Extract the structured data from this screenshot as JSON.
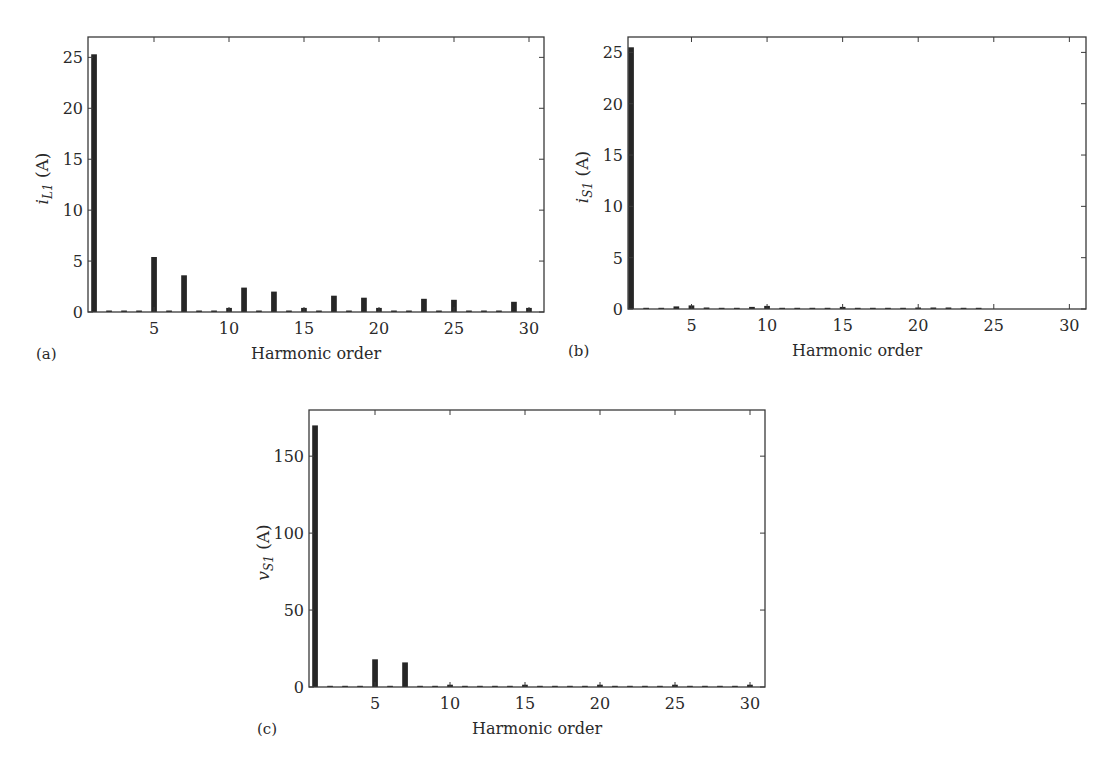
{
  "chart_data": [
    {
      "type": "bar",
      "panel_label": "(a)",
      "title": "",
      "xlabel": "Harmonic order",
      "ylabel": "i_L1 (A)",
      "ylabel_parts": {
        "symbol": "i",
        "subscript": "L1",
        "unit": "(A)"
      },
      "xlim": [
        0.6,
        31
      ],
      "ylim": [
        0,
        27
      ],
      "xticks": [
        5,
        10,
        15,
        20,
        25,
        30
      ],
      "yticks": [
        0,
        5,
        10,
        15,
        20,
        25
      ],
      "grid": false,
      "legend": null,
      "x": [
        1,
        2,
        3,
        4,
        5,
        6,
        7,
        8,
        9,
        10,
        11,
        12,
        13,
        14,
        15,
        16,
        17,
        18,
        19,
        20,
        21,
        22,
        23,
        24,
        25,
        26,
        27,
        28,
        29,
        30
      ],
      "values": [
        25.3,
        0.15,
        0.15,
        0.15,
        5.4,
        0.15,
        3.6,
        0.15,
        0.15,
        0.4,
        2.4,
        0.15,
        2.0,
        0.15,
        0.4,
        0.15,
        1.6,
        0.15,
        1.4,
        0.4,
        0.15,
        0.15,
        1.3,
        0.15,
        1.2,
        0.15,
        0.15,
        0.15,
        1.0,
        0.4
      ]
    },
    {
      "type": "bar",
      "panel_label": "(b)",
      "title": "",
      "xlabel": "Harmonic order",
      "ylabel": "i_S1 (A)",
      "ylabel_parts": {
        "symbol": "i",
        "subscript": "S1",
        "unit": "(A)"
      },
      "xlim": [
        0.8,
        31.1
      ],
      "ylim": [
        0,
        26.5
      ],
      "xticks": [
        5,
        10,
        15,
        20,
        25,
        30
      ],
      "yticks": [
        0,
        5,
        10,
        15,
        20,
        25
      ],
      "grid": false,
      "legend": null,
      "x": [
        1,
        2,
        3,
        4,
        5,
        6,
        7,
        8,
        9,
        10,
        11,
        12,
        13,
        14,
        15,
        16,
        17,
        18,
        19,
        20,
        21,
        22,
        23,
        24
      ],
      "values": [
        25.5,
        0.1,
        0.1,
        0.25,
        0.35,
        0.15,
        0.1,
        0.1,
        0.2,
        0.3,
        0.1,
        0.1,
        0.1,
        0.1,
        0.2,
        0.1,
        0.1,
        0.1,
        0.1,
        0.15,
        0.15,
        0.15,
        0.1,
        0.1
      ]
    },
    {
      "type": "bar",
      "panel_label": "(c)",
      "title": "",
      "xlabel": "Harmonic order",
      "ylabel": "v_S1 (A)",
      "ylabel_parts": {
        "symbol": "v",
        "subscript": "S1",
        "unit": "(A)"
      },
      "xlim": [
        0.6,
        31
      ],
      "ylim": [
        0,
        180
      ],
      "xticks": [
        5,
        10,
        15,
        20,
        25,
        30
      ],
      "yticks": [
        0,
        50,
        100,
        150
      ],
      "grid": false,
      "legend": null,
      "x": [
        1,
        2,
        3,
        4,
        5,
        6,
        7,
        8,
        9,
        10,
        11,
        12,
        13,
        14,
        15,
        16,
        17,
        18,
        19,
        20,
        21,
        22,
        23,
        24,
        25,
        26,
        27,
        28,
        29,
        30
      ],
      "values": [
        170,
        0.8,
        0.8,
        0.8,
        18,
        0.8,
        16,
        0.8,
        0.8,
        1.5,
        0.8,
        0.8,
        0.8,
        0.8,
        1.5,
        0.8,
        0.8,
        0.8,
        0.8,
        1.5,
        0.8,
        0.8,
        0.8,
        0.8,
        1.5,
        0.8,
        0.8,
        0.8,
        0.8,
        1.5
      ]
    }
  ],
  "panels": {
    "a": {
      "label": "(a)",
      "xlabel": "Harmonic order"
    },
    "b": {
      "label": "(b)",
      "xlabel": "Harmonic order"
    },
    "c": {
      "label": "(c)",
      "xlabel": "Harmonic order"
    }
  },
  "style": {
    "bar_color": "#262626",
    "axis_color": "#3a3a3a",
    "text_color": "#2a2a2a"
  }
}
